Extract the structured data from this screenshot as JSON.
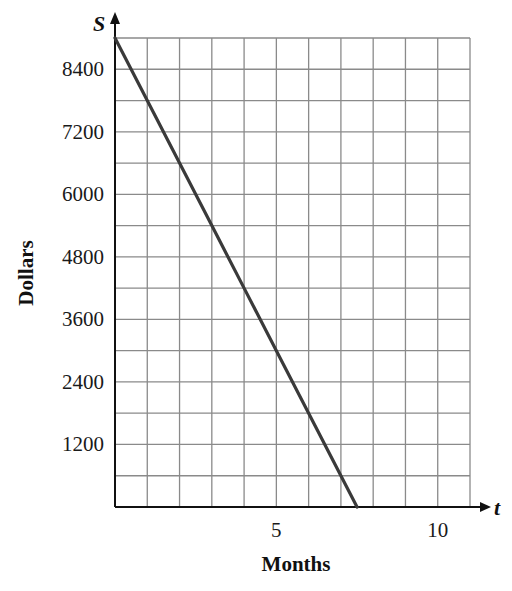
{
  "chart_data": {
    "type": "line",
    "title": "",
    "xlabel": "Months",
    "ylabel": "Dollars",
    "x_axis_variable": "t",
    "y_axis_variable": "S",
    "xlim": [
      0,
      11
    ],
    "ylim": [
      0,
      9000
    ],
    "x_ticks": [
      5,
      10
    ],
    "y_ticks": [
      1200,
      2400,
      3600,
      4800,
      6000,
      7200,
      8400
    ],
    "x_grid_step": 1,
    "y_grid_step": 600,
    "grid": true,
    "legend": null,
    "series": [
      {
        "name": "S",
        "equation": "S = 9000 - 1200t",
        "x": [
          0,
          1,
          2,
          3,
          4,
          5,
          6,
          7,
          7.5
        ],
        "values": [
          9000,
          7800,
          6600,
          5400,
          4200,
          3000,
          1800,
          600,
          0
        ],
        "color": "#3a3a3a"
      }
    ]
  }
}
